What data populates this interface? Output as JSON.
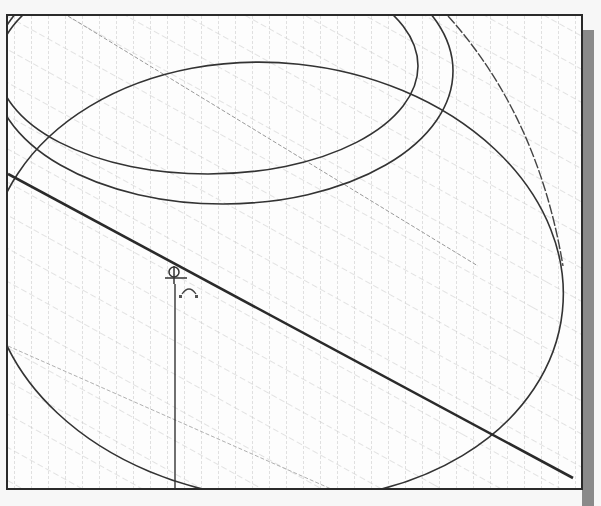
{
  "canvas": {
    "type": "cad-sketch-viewport",
    "grid": "isometric",
    "grid_color": "#bdbdbd",
    "line_color": "#333333",
    "shadow_color": "#8a8a8a"
  },
  "entities": {
    "inner_ellipse": {
      "cx": 230,
      "cy": 55,
      "rx": 200,
      "ry": 100
    },
    "outer_ellipse": {
      "cx": 260,
      "cy": 55,
      "rx": 190,
      "ry": 150
    },
    "large_ellipse": {
      "cx": 300,
      "cy": 285,
      "rx": 290,
      "ry": 215
    },
    "construction_arc": "right-side arc from top to ellipse tangent",
    "main_line": {
      "x1": 0,
      "y1": 158,
      "x2": 565,
      "y2": 462
    },
    "vertical_line": {
      "x1": 167,
      "y1": 258,
      "x2": 167,
      "y2": 476
    }
  },
  "markers": {
    "origin_symbol": "sketch-origin-icon",
    "constraint_symbol": "tangent-constraint-icon"
  }
}
